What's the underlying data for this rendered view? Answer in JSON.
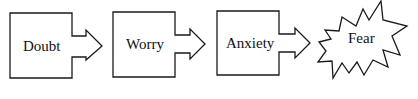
{
  "diagram": {
    "type": "flow",
    "stroke_color": "#1a1a1a",
    "fill_color": "#ffffff",
    "nodes": [
      {
        "id": "doubt",
        "label": "Doubt",
        "shape": "box-with-arrow"
      },
      {
        "id": "worry",
        "label": "Worry",
        "shape": "box-with-arrow"
      },
      {
        "id": "anxiety",
        "label": "Anxiety",
        "shape": "box-with-arrow"
      },
      {
        "id": "fear",
        "label": "Fear",
        "shape": "starburst"
      }
    ],
    "edges": [
      {
        "from": "doubt",
        "to": "worry"
      },
      {
        "from": "worry",
        "to": "anxiety"
      },
      {
        "from": "anxiety",
        "to": "fear"
      }
    ]
  }
}
